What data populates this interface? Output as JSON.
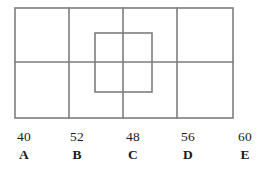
{
  "figure": {
    "name": "rectangle-grid-with-inner-square",
    "stroke_color": "#7d7d7d",
    "stroke_width": 1.6,
    "background_color": "#ffffff",
    "outer_rectangle": {
      "x1": 15,
      "y1": 8,
      "x2": 233,
      "y2": 118
    },
    "vertical_dividers": [
      69,
      123,
      177
    ],
    "horizontal_dividers": [
      62
    ],
    "inner_square": {
      "x1": 95,
      "y1": 33,
      "x2": 152,
      "y2": 92
    }
  },
  "answer_choices": [
    {
      "value": "40",
      "letter": "A",
      "x": 24
    },
    {
      "value": "52",
      "letter": "B",
      "x": 77
    },
    {
      "value": "48",
      "letter": "C",
      "x": 133
    },
    {
      "value": "56",
      "letter": "D",
      "x": 188
    },
    {
      "value": "60",
      "letter": "E",
      "x": 245
    }
  ]
}
